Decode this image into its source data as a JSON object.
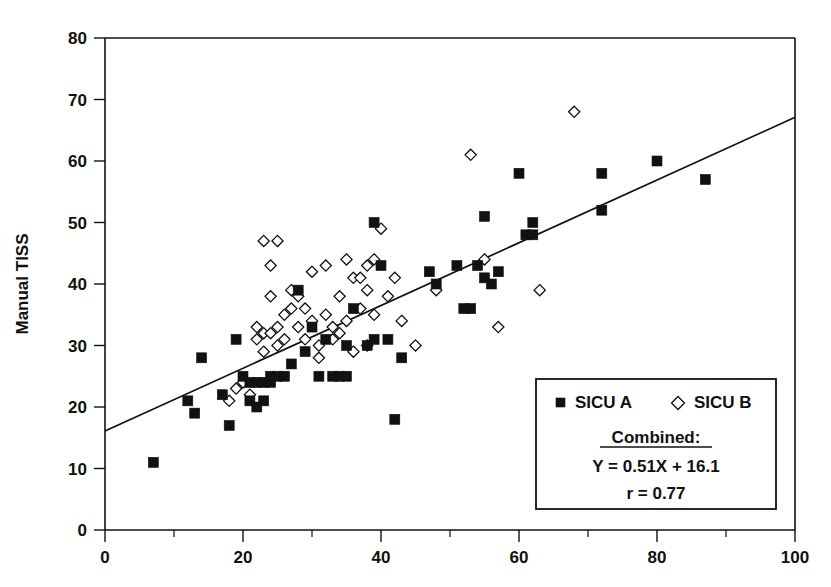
{
  "chart_data": {
    "type": "scatter",
    "title": "",
    "xlabel": "",
    "ylabel": "Manual TISS",
    "xlim": [
      0,
      100
    ],
    "ylim": [
      0,
      80
    ],
    "x_ticks": [
      0,
      20,
      40,
      60,
      80,
      100
    ],
    "x_minor_ticks": [
      10,
      30,
      50,
      70,
      90
    ],
    "y_ticks": [
      0,
      10,
      20,
      30,
      40,
      50,
      60,
      70,
      80
    ],
    "x_tick_labels": [
      "0",
      "20",
      "40",
      "60",
      "80",
      "100"
    ],
    "y_tick_labels": [
      "0",
      "10",
      "20",
      "30",
      "40",
      "50",
      "60",
      "70",
      "80"
    ],
    "grid": false,
    "legend_position": "lower-right",
    "series": [
      {
        "name": "SICU A",
        "marker": "filled-square",
        "color": "#111111",
        "points": [
          [
            7,
            11
          ],
          [
            12,
            21
          ],
          [
            13,
            19
          ],
          [
            14,
            28
          ],
          [
            17,
            22
          ],
          [
            18,
            17
          ],
          [
            19,
            31
          ],
          [
            20,
            25
          ],
          [
            21,
            21
          ],
          [
            21,
            24
          ],
          [
            22,
            24
          ],
          [
            22,
            20
          ],
          [
            23,
            24
          ],
          [
            23,
            21
          ],
          [
            24,
            24
          ],
          [
            24,
            25
          ],
          [
            25,
            25
          ],
          [
            26,
            25
          ],
          [
            27,
            27
          ],
          [
            28,
            39
          ],
          [
            29,
            29
          ],
          [
            30,
            33
          ],
          [
            31,
            25
          ],
          [
            32,
            31
          ],
          [
            33,
            25
          ],
          [
            34,
            25
          ],
          [
            35,
            25
          ],
          [
            35,
            30
          ],
          [
            36,
            36
          ],
          [
            38,
            30
          ],
          [
            39,
            50
          ],
          [
            39,
            31
          ],
          [
            40,
            43
          ],
          [
            41,
            31
          ],
          [
            42,
            18
          ],
          [
            43,
            28
          ],
          [
            47,
            42
          ],
          [
            48,
            40
          ],
          [
            51,
            43
          ],
          [
            52,
            36
          ],
          [
            53,
            36
          ],
          [
            54,
            43
          ],
          [
            55,
            51
          ],
          [
            55,
            41
          ],
          [
            56,
            40
          ],
          [
            57,
            42
          ],
          [
            60,
            58
          ],
          [
            61,
            48
          ],
          [
            62,
            48
          ],
          [
            62,
            50
          ],
          [
            72,
            58
          ],
          [
            72,
            52
          ],
          [
            80,
            60
          ],
          [
            87,
            57
          ]
        ]
      },
      {
        "name": "SICU B",
        "marker": "open-diamond",
        "color": "#ffffff",
        "points": [
          [
            18,
            21
          ],
          [
            19,
            23
          ],
          [
            20,
            24
          ],
          [
            21,
            22
          ],
          [
            22,
            31
          ],
          [
            22,
            33
          ],
          [
            23,
            47
          ],
          [
            23,
            32
          ],
          [
            23,
            29
          ],
          [
            24,
            43
          ],
          [
            24,
            38
          ],
          [
            24,
            32
          ],
          [
            25,
            47
          ],
          [
            25,
            33
          ],
          [
            25,
            30
          ],
          [
            26,
            35
          ],
          [
            26,
            31
          ],
          [
            27,
            39
          ],
          [
            27,
            36
          ],
          [
            28,
            38
          ],
          [
            28,
            33
          ],
          [
            29,
            36
          ],
          [
            29,
            31
          ],
          [
            30,
            42
          ],
          [
            30,
            34
          ],
          [
            31,
            30
          ],
          [
            31,
            28
          ],
          [
            32,
            43
          ],
          [
            32,
            35
          ],
          [
            33,
            33
          ],
          [
            33,
            31
          ],
          [
            34,
            38
          ],
          [
            34,
            32
          ],
          [
            35,
            44
          ],
          [
            35,
            34
          ],
          [
            36,
            41
          ],
          [
            36,
            29
          ],
          [
            37,
            41
          ],
          [
            37,
            36
          ],
          [
            38,
            43
          ],
          [
            38,
            39
          ],
          [
            38,
            30
          ],
          [
            39,
            44
          ],
          [
            39,
            35
          ],
          [
            40,
            49
          ],
          [
            41,
            38
          ],
          [
            42,
            41
          ],
          [
            43,
            34
          ],
          [
            45,
            30
          ],
          [
            48,
            39
          ],
          [
            53,
            61
          ],
          [
            55,
            44
          ],
          [
            57,
            33
          ],
          [
            63,
            39
          ],
          [
            68,
            68
          ]
        ]
      }
    ],
    "fit_line": {
      "label": "Combined",
      "equation": "Y = 0.51X + 16.1",
      "slope": 0.51,
      "intercept": 16.1,
      "correlation_label": "r = 0.77",
      "r": 0.77,
      "x_start": 0,
      "x_end": 100,
      "y_start": 16.1,
      "y_end": 67.1
    }
  },
  "legend": {
    "series_a_label": "SICU A",
    "series_b_label": "SICU B",
    "combined_heading": "Combined:",
    "equation": "Y = 0.51X + 16.1",
    "correlation": "r = 0.77"
  },
  "axes": {
    "y_title": "Manual TISS",
    "x_title": ""
  }
}
